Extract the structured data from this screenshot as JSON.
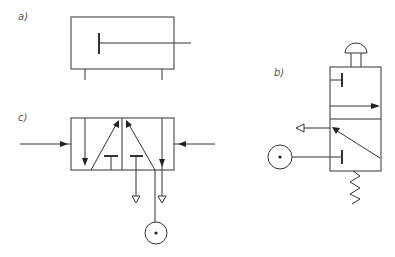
{
  "diagram": {
    "type": "pneumatic schematic symbols",
    "parts": [
      {
        "label": "a)",
        "name": "single-acting cylinder"
      },
      {
        "label": "b)",
        "name": "3/2 push-button valve with spring return"
      },
      {
        "label": "c)",
        "name": "5/2 double pilot valve"
      }
    ]
  },
  "colors": {
    "line": "#333333",
    "background": "#ffffff",
    "label": "#555555"
  }
}
